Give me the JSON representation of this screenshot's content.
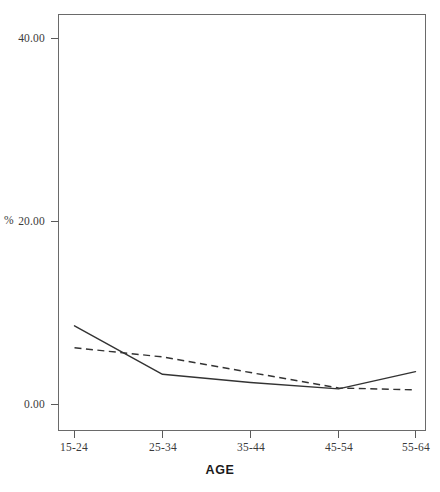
{
  "chart_data": {
    "type": "line",
    "title": "",
    "xlabel": "AGE",
    "ylabel": "%",
    "categories": [
      "15-24",
      "25-34",
      "35-44",
      "45-54",
      "55-64"
    ],
    "series": [
      {
        "name": "solid-line",
        "style": "solid",
        "color": "#333333",
        "values": [
          8.6,
          3.3,
          2.4,
          1.7,
          3.6
        ]
      },
      {
        "name": "dashed-line",
        "style": "dashed",
        "color": "#333333",
        "values": [
          6.2,
          5.2,
          3.5,
          1.8,
          1.6
        ]
      }
    ],
    "ylim": [
      0.0,
      44.0
    ],
    "yticks": [
      0.0,
      20.0,
      40.0
    ],
    "ytick_labels": [
      "0.00",
      "20.00",
      "40.00"
    ],
    "grid": false,
    "legend": "none",
    "axis_color": "#555555",
    "background": "#ffffff"
  },
  "axes": {
    "y_title": "%",
    "x_title": "AGE",
    "y_tick_labels": [
      "40.00",
      "20.00",
      "0.00"
    ],
    "x_tick_labels": [
      "15-24",
      "25-34",
      "35-44",
      "45-54",
      "55-64"
    ]
  }
}
